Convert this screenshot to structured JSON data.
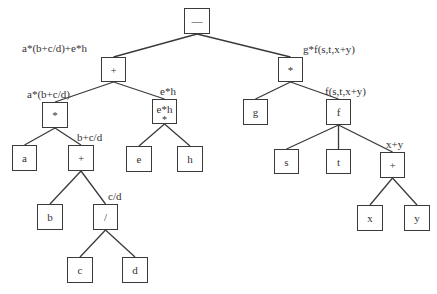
{
  "diagram": {
    "type": "expression-tree",
    "nodes": [
      {
        "id": "root",
        "symbol": "—",
        "x": 184,
        "y": 8,
        "w": 26,
        "h": 26
      },
      {
        "id": "plus1",
        "symbol": "+",
        "x": 101,
        "y": 57,
        "w": 25,
        "h": 25,
        "label": "a*(b+c/d)+e*h",
        "lx": 22,
        "ly": 42
      },
      {
        "id": "star1",
        "symbol": "*",
        "x": 42,
        "y": 102,
        "w": 26,
        "h": 26,
        "label": "a*(b+c/d)",
        "lx": 27,
        "ly": 88
      },
      {
        "id": "eh",
        "symbol": "e*h",
        "sub": "*",
        "x": 152,
        "y": 99,
        "w": 25,
        "h": 25,
        "label": "e*h",
        "lx": 160,
        "ly": 85
      },
      {
        "id": "a",
        "symbol": "a",
        "x": 12,
        "y": 145,
        "w": 25,
        "h": 26
      },
      {
        "id": "plus2",
        "symbol": "+",
        "x": 68,
        "y": 145,
        "w": 26,
        "h": 26,
        "label": "b+c/d",
        "lx": 77,
        "ly": 131
      },
      {
        "id": "e",
        "symbol": "e",
        "x": 126,
        "y": 146,
        "w": 26,
        "h": 26
      },
      {
        "id": "h",
        "symbol": "h",
        "x": 177,
        "y": 146,
        "w": 26,
        "h": 26
      },
      {
        "id": "b",
        "symbol": "b",
        "x": 37,
        "y": 204,
        "w": 26,
        "h": 26
      },
      {
        "id": "div",
        "symbol": "/",
        "x": 93,
        "y": 204,
        "w": 25,
        "h": 26,
        "label": "c/d",
        "lx": 108,
        "ly": 190
      },
      {
        "id": "c",
        "symbol": "c",
        "x": 67,
        "y": 257,
        "w": 26,
        "h": 26
      },
      {
        "id": "d",
        "symbol": "d",
        "x": 122,
        "y": 257,
        "w": 26,
        "h": 26
      },
      {
        "id": "star2",
        "symbol": "*",
        "x": 278,
        "y": 57,
        "w": 25,
        "h": 25,
        "label": "g*f(s,t,x+y)",
        "lx": 303,
        "ly": 43
      },
      {
        "id": "g",
        "symbol": "g",
        "x": 243,
        "y": 99,
        "w": 25,
        "h": 26
      },
      {
        "id": "f",
        "symbol": "f",
        "x": 326,
        "y": 99,
        "w": 25,
        "h": 26,
        "label": "f(s,t,x+y)",
        "lx": 325,
        "ly": 85
      },
      {
        "id": "s",
        "symbol": "s",
        "x": 274,
        "y": 149,
        "w": 25,
        "h": 25
      },
      {
        "id": "t",
        "symbol": "t",
        "x": 326,
        "y": 149,
        "w": 25,
        "h": 25
      },
      {
        "id": "plus3",
        "symbol": "+",
        "x": 380,
        "y": 152,
        "w": 25,
        "h": 26,
        "label": "x+y",
        "lx": 386,
        "ly": 138
      },
      {
        "id": "x",
        "symbol": "x",
        "x": 357,
        "y": 205,
        "w": 26,
        "h": 26
      },
      {
        "id": "y",
        "symbol": "y",
        "x": 404,
        "y": 205,
        "w": 26,
        "h": 26
      }
    ],
    "edges": [
      [
        "root",
        "plus1"
      ],
      [
        "root",
        "star2"
      ],
      [
        "plus1",
        "star1"
      ],
      [
        "plus1",
        "eh"
      ],
      [
        "star1",
        "a"
      ],
      [
        "star1",
        "plus2"
      ],
      [
        "plus2",
        "b"
      ],
      [
        "plus2",
        "div"
      ],
      [
        "div",
        "c"
      ],
      [
        "div",
        "d"
      ],
      [
        "eh",
        "e"
      ],
      [
        "eh",
        "h"
      ],
      [
        "star2",
        "g"
      ],
      [
        "star2",
        "f"
      ],
      [
        "f",
        "s"
      ],
      [
        "f",
        "t"
      ],
      [
        "f",
        "plus3"
      ],
      [
        "plus3",
        "x"
      ],
      [
        "plus3",
        "y"
      ]
    ],
    "line_color": "#3a3a3a"
  }
}
